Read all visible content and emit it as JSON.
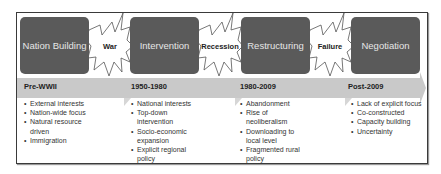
{
  "stages": [
    {
      "label": "Nation Building",
      "period": "Pre-WWII",
      "bullets": [
        "External interests",
        "Nation-wide focus",
        "Natural resource driven",
        "Immigration"
      ]
    },
    {
      "label": "Intervention",
      "period": "1950-1980",
      "bullets": [
        "National interests",
        "Top-down intervention",
        "Socio-economic expansion",
        "Explicit regional policy"
      ]
    },
    {
      "label": "Restructuring",
      "period": "1980-2009",
      "bullets": [
        "Abandonment",
        "Rise of neoliberalism",
        "Downloading to local level",
        "Fragmented rural policy"
      ]
    },
    {
      "label": "Negotiation",
      "period": "Post-2009",
      "bullets": [
        "Lack of explicit focus",
        "Co-constructed",
        "Capacity building",
        "Uncertainty"
      ]
    }
  ],
  "transitions": [
    {
      "label": "War"
    },
    {
      "label": "Recession"
    },
    {
      "label": "Failure"
    }
  ],
  "colors": {
    "box": "#5a5a5a",
    "box_text": "#e6e6e6",
    "arrow_band": "#c8c8c8",
    "frame": "#3a3a3a"
  }
}
